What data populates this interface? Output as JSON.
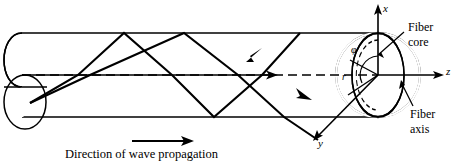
{
  "figure": {
    "stroke_color": "#000000",
    "background_color": "#ffffff",
    "caption": {
      "text": "Direction of wave propagation",
      "arrow": "right-arrow"
    },
    "axes": [
      {
        "name": "x-axis",
        "label": "x",
        "direction": "up",
        "label_x": 383,
        "label_y": 4
      },
      {
        "name": "z-axis",
        "label": "z",
        "direction": "right",
        "label_x": 446,
        "label_y": 68
      },
      {
        "name": "y-axis",
        "label": "y",
        "direction": "down-left",
        "label_x": 318,
        "label_y": 140
      }
    ],
    "coordinate_symbols": [
      {
        "name": "azimuthal-angle",
        "label": "φ",
        "label_x": 351,
        "label_y": 46
      },
      {
        "name": "radius",
        "label": "r",
        "label_x": 342,
        "label_y": 74
      }
    ],
    "annotations": [
      {
        "name": "fiber-core-label",
        "lines": [
          "Fiber",
          "core"
        ],
        "label_x": 408,
        "label_y": 24,
        "leader": "arrow-to-core-face"
      },
      {
        "name": "fiber-axis-label",
        "lines": [
          "Fiber",
          "axis"
        ],
        "label_x": 410,
        "label_y": 110,
        "leader": "line-to-axis"
      }
    ],
    "elements": {
      "cylinder": "fiber-core-cylinder",
      "cross_section": "fiber-end-face-ellipse",
      "inner_arc": "inner-radius-dashed-arc",
      "rays": "zigzag-ray-paths",
      "center_line": "dashed-fiber-axis-line"
    }
  }
}
